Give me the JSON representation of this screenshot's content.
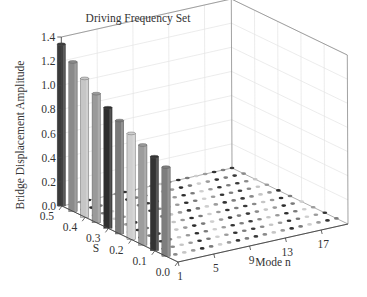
{
  "chart_data": {
    "type": "bar3d",
    "title": "Driving Frequency Set",
    "zlabel": "Bridge Displacement Amplitude",
    "xlabel": "Mode n",
    "ylabel": "S",
    "z_ticks": [
      "0.0",
      "0.2",
      "0.4",
      "0.6",
      "0.8",
      "1.0",
      "1.2",
      "1.4"
    ],
    "zlim": [
      0,
      1.4
    ],
    "s_ticks": [
      "0.5",
      "0.4",
      "0.3",
      "0.2",
      "0.1",
      "0.0"
    ],
    "slim": [
      0,
      0.5
    ],
    "n_ticks": [
      "1",
      "5",
      "9",
      "13",
      "17"
    ],
    "nlim": [
      1,
      20
    ],
    "grid": true,
    "bars": {
      "mode_n": 1,
      "s_values": [
        0.5,
        0.45,
        0.4,
        0.35,
        0.3,
        0.25,
        0.2,
        0.15,
        0.1,
        0.05
      ],
      "amplitudes": [
        1.34,
        1.24,
        1.15,
        1.07,
        1.0,
        0.94,
        0.88,
        0.83,
        0.78,
        0.74
      ],
      "colors": [
        "#3a3a3a",
        "#8a8a8a",
        "#c6c6c6",
        "#9a9a9a",
        "#2e2e2e",
        "#7a7a7a",
        "#cfcfcf",
        "#9c9c9c",
        "#333333",
        "#7e7e7e"
      ]
    },
    "floor_dots_note": "Near-zero amplitude markers for modes n = 2..20 at each S value",
    "floor_modes": [
      3,
      5,
      7,
      9,
      11,
      13,
      15,
      17,
      19
    ],
    "floor_dot_colors": [
      "#3a3a3a",
      "#8a8a8a",
      "#c6c6c6",
      "#9a9a9a",
      "#2e2e2e",
      "#7a7a7a",
      "#cfcfcf",
      "#9c9c9c",
      "#333333",
      "#7e7e7e"
    ]
  }
}
